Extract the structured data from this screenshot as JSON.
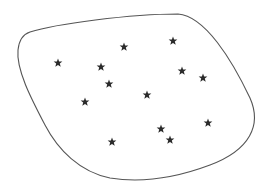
{
  "figure": {
    "outline_color": "#555555",
    "star_color": "#2b2b2b",
    "star_count": 13,
    "stars": [
      {
        "x": 124,
        "y": 47
      },
      {
        "x": 173,
        "y": 41
      },
      {
        "x": 58,
        "y": 63
      },
      {
        "x": 101,
        "y": 67
      },
      {
        "x": 182,
        "y": 71
      },
      {
        "x": 203,
        "y": 78
      },
      {
        "x": 109,
        "y": 84
      },
      {
        "x": 147,
        "y": 95
      },
      {
        "x": 85,
        "y": 102
      },
      {
        "x": 208,
        "y": 123
      },
      {
        "x": 161,
        "y": 129
      },
      {
        "x": 170,
        "y": 140
      },
      {
        "x": 112,
        "y": 142
      }
    ]
  }
}
